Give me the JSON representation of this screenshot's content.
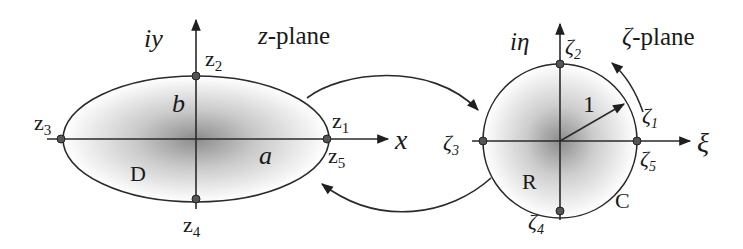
{
  "colors": {
    "stroke": "#2a2a2a",
    "text": "#1a1a1a",
    "shade_center": "#8c8c8c",
    "background": "#ffffff"
  },
  "z_plane": {
    "title": "z-plane",
    "title_var": "z",
    "title_suffix": "-plane",
    "axis_real_label": "x",
    "axis_imag_label": "iy",
    "region_label": "D",
    "semi_major_label": "a",
    "semi_minor_label": "b",
    "shape": "ellipse",
    "points": [
      {
        "name": "z",
        "sub": "1",
        "position": "right, above axis"
      },
      {
        "name": "z",
        "sub": "2",
        "position": "top"
      },
      {
        "name": "z",
        "sub": "3",
        "position": "left"
      },
      {
        "name": "z",
        "sub": "4",
        "position": "bottom"
      },
      {
        "name": "z",
        "sub": "5",
        "position": "right, below axis"
      }
    ]
  },
  "zeta_plane": {
    "title": "ζ-plane",
    "title_var": "ζ",
    "title_suffix": "-plane",
    "axis_real_label": "ξ",
    "axis_imag_label": "iη",
    "region_label": "R",
    "contour_label": "C",
    "radius_label": "1",
    "shape": "unit circle",
    "points": [
      {
        "name": "ζ",
        "sub": "1",
        "position": "right, above axis"
      },
      {
        "name": "ζ",
        "sub": "2",
        "position": "top"
      },
      {
        "name": "ζ",
        "sub": "3",
        "position": "left"
      },
      {
        "name": "ζ",
        "sub": "4",
        "position": "bottom"
      },
      {
        "name": "ζ",
        "sub": "5",
        "position": "right, below axis"
      }
    ]
  },
  "mapping_arrows": [
    {
      "from": "z-plane",
      "to": "ζ-plane",
      "position": "top"
    },
    {
      "from": "ζ-plane",
      "to": "z-plane",
      "position": "bottom"
    }
  ],
  "orientation_arrow": {
    "direction": "counter-clockwise",
    "position": "near ζ1"
  }
}
